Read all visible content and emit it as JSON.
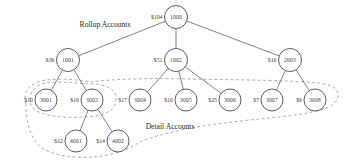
{
  "diagram": {
    "title_labels": [
      {
        "id": "rollup-accounts-label",
        "text": "Rollup Accounts",
        "x": 105,
        "y": 24
      },
      {
        "id": "detail-accounts-label",
        "text": "Detail Accounts",
        "x": 170,
        "y": 126
      }
    ],
    "nodes": [
      {
        "id": "n1000",
        "label": "1000",
        "amount": "$104",
        "x": 176,
        "y": 17,
        "r": 11.5,
        "level": 1
      },
      {
        "id": "n1001",
        "label": "1001",
        "amount": "$36",
        "x": 68,
        "y": 60,
        "r": 11.5,
        "level": 2
      },
      {
        "id": "n1002",
        "label": "1002",
        "amount": "$51",
        "x": 176,
        "y": 60,
        "r": 11.5,
        "level": 2
      },
      {
        "id": "n2003",
        "label": "2003",
        "amount": "$16",
        "x": 290,
        "y": 60,
        "r": 11.5,
        "level": 2
      },
      {
        "id": "n3001",
        "label": "3001",
        "amount": "$10",
        "x": 46,
        "y": 100,
        "r": 11.0,
        "level": 3
      },
      {
        "id": "n3002",
        "label": "3002",
        "amount": "$16",
        "x": 92,
        "y": 100,
        "r": 11.0,
        "level": 3
      },
      {
        "id": "n3004",
        "label": "3004",
        "amount": "$17",
        "x": 140,
        "y": 100,
        "r": 11.0,
        "level": 3
      },
      {
        "id": "n3005",
        "label": "3005",
        "amount": "$10",
        "x": 186,
        "y": 100,
        "r": 11.0,
        "level": 3
      },
      {
        "id": "n3006",
        "label": "3006",
        "amount": "$25",
        "x": 230,
        "y": 100,
        "r": 11.0,
        "level": 3
      },
      {
        "id": "n3007",
        "label": "3007",
        "amount": "$7",
        "x": 272,
        "y": 100,
        "r": 11.0,
        "level": 3
      },
      {
        "id": "n3008",
        "label": "3008",
        "amount": "$9",
        "x": 315,
        "y": 100,
        "r": 11.0,
        "level": 3
      },
      {
        "id": "n4001",
        "label": "4001",
        "amount": "$12",
        "x": 76,
        "y": 141,
        "r": 11.0,
        "level": 4
      },
      {
        "id": "n4002",
        "label": "4002",
        "amount": "$14",
        "x": 118,
        "y": 141,
        "r": 11.0,
        "level": 4
      }
    ],
    "edges": [
      {
        "from": "n1000",
        "to": "n1001"
      },
      {
        "from": "n1000",
        "to": "n1002"
      },
      {
        "from": "n1000",
        "to": "n2003"
      },
      {
        "from": "n1001",
        "to": "n3001"
      },
      {
        "from": "n1001",
        "to": "n3002"
      },
      {
        "from": "n1002",
        "to": "n3004"
      },
      {
        "from": "n1002",
        "to": "n3005"
      },
      {
        "from": "n1002",
        "to": "n3006"
      },
      {
        "from": "n2003",
        "to": "n3007"
      },
      {
        "from": "n2003",
        "to": "n3008"
      },
      {
        "from": "n3002",
        "to": "n4001"
      },
      {
        "from": "n3002",
        "to": "n4002"
      }
    ],
    "hulls": [
      {
        "id": "detail-accounts-hull",
        "path": "M 26 104 C 22 92 30 82 46 80 C 62 78 80 80 92 82 C 110 79 150 78 190 79 C 240 80 300 80 325 84 C 340 87 342 98 332 105 C 320 113 290 116 250 120 C 200 125 160 133 140 142 C 128 150 110 156 92 157 C 74 158 54 156 42 148 C 30 140 26 120 26 104 Z"
      },
      {
        "id": "group-3001-3002-hull",
        "path": "M 30 100 C 30 88 40 82 56 82 C 72 82 82 84 92 84 C 104 84 114 88 116 96 C 118 106 110 114 96 116 C 80 118 62 118 48 115 C 36 112 30 108 30 100 Z"
      }
    ],
    "colors": {
      "node_stroke": "#4a4a4a",
      "edge_stroke": "#5a5a5a",
      "hull_stroke": "#9a9a9a",
      "text": "#3a3a3a",
      "background": "#ffffff"
    }
  }
}
